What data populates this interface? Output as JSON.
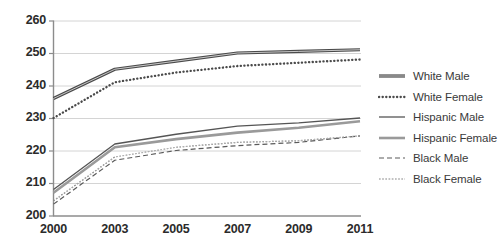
{
  "chart_data": {
    "type": "line",
    "title": "",
    "subtitle": "",
    "xlabel": "",
    "ylabel": "",
    "categories": [
      "2000",
      "2003",
      "2005",
      "2007",
      "2009",
      "2011"
    ],
    "x_tick_labels": [
      "2000",
      "2003",
      "2005",
      "2007",
      "2009",
      "2011"
    ],
    "y_tick_labels": [
      "200",
      "210",
      "220",
      "230",
      "240",
      "250",
      "260"
    ],
    "y_ticks": [
      200,
      210,
      220,
      230,
      240,
      250,
      260
    ],
    "ylim": [
      200,
      260
    ],
    "grid": true,
    "grid_axis": "y",
    "legend_position": "right",
    "series": [
      {
        "name": "White Male",
        "values": [
          236,
          245,
          247.5,
          250,
          250.5,
          251
        ],
        "style": "solid-thick",
        "color": "#4a4a4a",
        "width": 3.2,
        "dash": ""
      },
      {
        "name": "White Female",
        "values": [
          230,
          241,
          244,
          246,
          247,
          248
        ],
        "style": "dotted",
        "color": "#4a4a4a",
        "width": 2.3,
        "dash": "0.2,3.4"
      },
      {
        "name": "Hispanic Male",
        "values": [
          208,
          222,
          225,
          227.5,
          228.5,
          230
        ],
        "style": "solid-thin",
        "color": "#555555",
        "width": 1.3,
        "dash": ""
      },
      {
        "name": "Hispanic Female",
        "values": [
          207,
          221,
          223.5,
          225.5,
          227,
          229
        ],
        "style": "solid-thick-gray",
        "color": "#9a9a9a",
        "width": 2.6,
        "dash": ""
      },
      {
        "name": "Black Male",
        "values": [
          203.5,
          217,
          220,
          221.5,
          222.5,
          224.5
        ],
        "style": "dashed",
        "color": "#5a5a5a",
        "width": 1.2,
        "dash": "5,3"
      },
      {
        "name": "Black Female",
        "values": [
          204.5,
          218,
          221,
          222.5,
          223,
          224.5
        ],
        "style": "chain-circles",
        "color": "#5a5a5a",
        "width": 1.2,
        "dash": "1.6,1.6"
      }
    ],
    "colors": {
      "axis": "#8c8c8c",
      "grid": "#d4d4d4",
      "tick_text": "#2b2b2b",
      "legend_text": "#3a3a3a",
      "background": "#ffffff"
    }
  }
}
